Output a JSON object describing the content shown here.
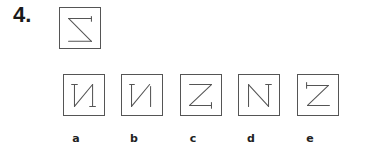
{
  "question": {
    "number": "4.",
    "prompt_figure": "sigma-like-z-mirrored"
  },
  "options": [
    {
      "label": "a",
      "figure": "mirrored-n-with-serifs"
    },
    {
      "label": "b",
      "figure": "mirrored-n-plain"
    },
    {
      "label": "c",
      "figure": "z-with-bottom-tick"
    },
    {
      "label": "d",
      "figure": "n-with-top-tick"
    },
    {
      "label": "e",
      "figure": "z-with-top-tick"
    }
  ],
  "colors": {
    "stroke": "#555555",
    "text": "#1a1a1a",
    "background": "#ffffff"
  }
}
